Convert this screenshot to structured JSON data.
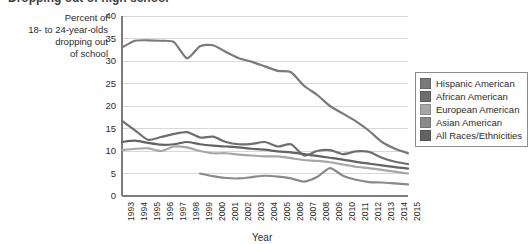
{
  "title": "Dropping out of high school",
  "axis": {
    "y_caption_lines": [
      "Percent of",
      "18- to 24-year-olds",
      "dropping out",
      "of school"
    ],
    "y_ticks": [
      "0",
      "5",
      "10",
      "15",
      "20",
      "25",
      "30",
      "35",
      "40"
    ],
    "y_min": 0,
    "y_max": 40,
    "x_label": "Year",
    "x_ticks": [
      "1993",
      "1994",
      "1995",
      "1996",
      "1997",
      "1998",
      "1999",
      "2000",
      "2001",
      "2002",
      "2003",
      "2004",
      "2005",
      "2006",
      "2007",
      "2008",
      "2009",
      "2010",
      "2011",
      "2012",
      "2013",
      "2014",
      "2015"
    ]
  },
  "legend": {
    "items": [
      {
        "label": "Hispanic American",
        "color": "#7a7a7a"
      },
      {
        "label": "African American",
        "color": "#6e6e6e"
      },
      {
        "label": "European American",
        "color": "#a6a6a6"
      },
      {
        "label": "Asian American",
        "color": "#8a8a8a"
      },
      {
        "label": "All Races/Ethnicities",
        "color": "#636363"
      }
    ]
  },
  "chart_data": {
    "type": "line",
    "title": "Dropping out of high school",
    "xlabel": "Year",
    "ylabel": "Percent of 18- to 24-year-olds dropping out of school",
    "ylim": [
      0,
      40
    ],
    "xlim": [
      1993,
      2015
    ],
    "grid": "horizontal",
    "legend_position": "right",
    "x": [
      1993,
      1994,
      1995,
      1996,
      1997,
      1998,
      1999,
      2000,
      2001,
      2002,
      2003,
      2004,
      2005,
      2006,
      2007,
      2008,
      2009,
      2010,
      2011,
      2012,
      2013,
      2014,
      2015
    ],
    "series": [
      {
        "name": "Hispanic American",
        "color": "#7a7a7a",
        "values": [
          33.0,
          34.5,
          34.6,
          34.5,
          34.2,
          30.6,
          33.3,
          33.5,
          32.0,
          30.6,
          29.8,
          28.8,
          27.8,
          27.5,
          24.5,
          22.5,
          20.0,
          18.3,
          16.6,
          14.5,
          12.0,
          10.5,
          9.5
        ]
      },
      {
        "name": "African American",
        "color": "#6e6e6e",
        "values": [
          16.7,
          14.6,
          12.5,
          13.1,
          13.8,
          14.2,
          13.0,
          13.2,
          12.0,
          11.5,
          11.6,
          12.0,
          11.0,
          11.5,
          9.0,
          10.0,
          10.2,
          9.3,
          9.9,
          9.8,
          8.5,
          7.6,
          7.1
        ]
      },
      {
        "name": "European American",
        "color": "#a6a6a6",
        "values": [
          10.2,
          10.5,
          10.6,
          10.0,
          11.0,
          10.8,
          10.0,
          9.5,
          9.5,
          9.2,
          9.0,
          8.8,
          8.8,
          8.4,
          8.0,
          7.8,
          7.5,
          7.0,
          6.5,
          6.2,
          5.8,
          5.4,
          5.0
        ]
      },
      {
        "name": "Asian American",
        "color": "#8a8a8a",
        "values": [
          null,
          null,
          null,
          null,
          null,
          null,
          5.0,
          4.4,
          4.0,
          3.9,
          4.2,
          4.5,
          4.3,
          3.9,
          3.2,
          4.2,
          6.2,
          4.5,
          3.6,
          3.1,
          3.0,
          2.8,
          2.6
        ]
      },
      {
        "name": "All Races/Ethnicities",
        "color": "#636363",
        "values": [
          12.0,
          12.3,
          11.8,
          11.4,
          11.5,
          12.0,
          11.5,
          11.2,
          11.0,
          10.8,
          10.5,
          10.3,
          9.9,
          9.7,
          9.3,
          8.9,
          8.5,
          8.1,
          7.6,
          7.2,
          6.8,
          6.4,
          6.1
        ]
      }
    ]
  }
}
